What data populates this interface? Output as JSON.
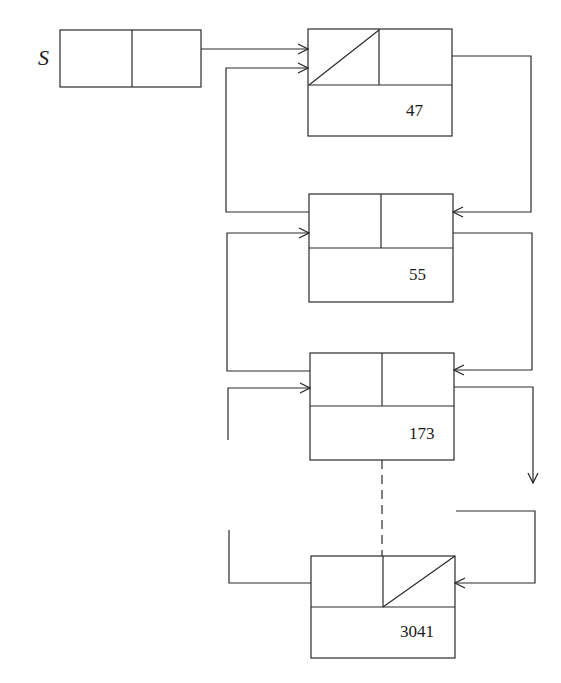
{
  "diagram": {
    "title": "",
    "pointer_label": "S",
    "nodes": [
      {
        "id": "node-1",
        "value": "47",
        "left_field": "null (slashed)",
        "right_field": "pointer"
      },
      {
        "id": "node-2",
        "value": "55",
        "left_field": "pointer",
        "right_field": "pointer"
      },
      {
        "id": "node-3",
        "value": "173",
        "left_field": "pointer",
        "right_field": "pointer"
      },
      {
        "id": "node-4",
        "value": "3041",
        "left_field": "pointer",
        "right_field": "null (slashed)"
      }
    ],
    "edges": [
      {
        "from": "S",
        "to": "node-1",
        "style": "solid-arrow"
      },
      {
        "from": "node-1.right",
        "to": "node-2",
        "style": "solid-arrow"
      },
      {
        "from": "node-2.left",
        "to": "node-1",
        "style": "solid-arrow"
      },
      {
        "from": "node-2.right",
        "to": "node-3",
        "style": "solid-arrow"
      },
      {
        "from": "node-3.left",
        "to": "node-2",
        "style": "solid-arrow"
      },
      {
        "from": "node-3.right",
        "to": "...",
        "style": "solid-arrow"
      },
      {
        "from": "...",
        "to": "node-3",
        "style": "solid-arrow"
      },
      {
        "from": "node-3",
        "to": "node-4",
        "style": "dashed"
      },
      {
        "from": "node-4.left",
        "to": "...",
        "style": "solid"
      },
      {
        "from": "...",
        "to": "node-4",
        "style": "solid-arrow"
      }
    ],
    "colors": {
      "line": "#2a2a2a",
      "background": "#ffffff"
    }
  }
}
